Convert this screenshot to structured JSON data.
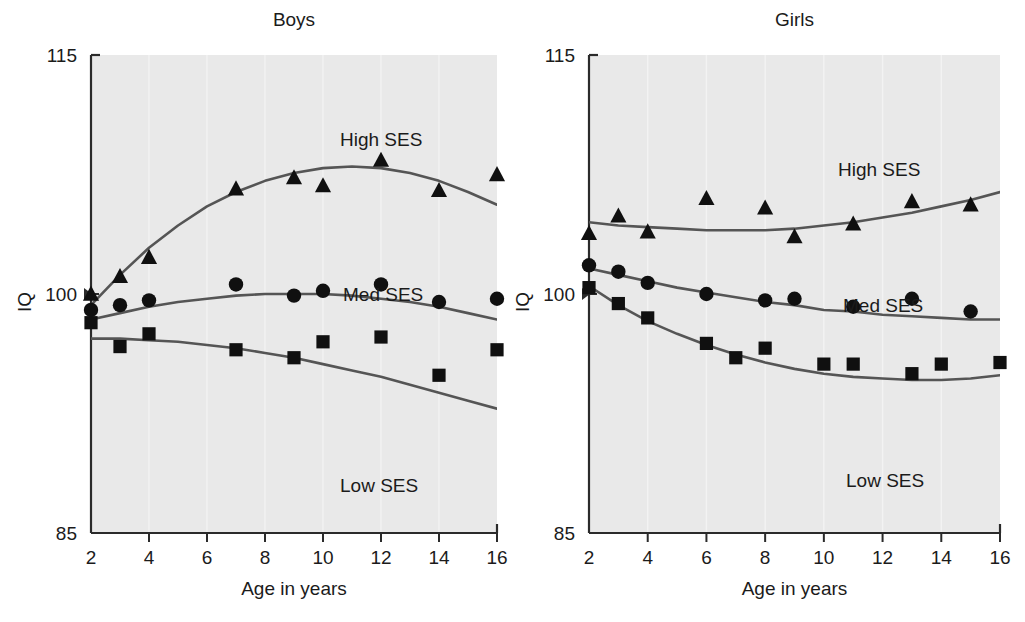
{
  "figure": {
    "background": "#ffffff",
    "plot_background": "#e9e9e9",
    "axis_color": "#2b2b2b",
    "marker_color": "#101010",
    "curve_color": "#555555"
  },
  "axis": {
    "y_label": "IQ",
    "x_label_boys": "Age in years",
    "x_label_girls": "Age in years",
    "y_ticks": [
      "115",
      "100",
      "85"
    ],
    "x_ticks": [
      "2",
      "4",
      "6",
      "8",
      "10",
      "12",
      "14",
      "16"
    ]
  },
  "panels": [
    {
      "key": "boys",
      "title": "Boys"
    },
    {
      "key": "girls",
      "title": "Girls"
    }
  ],
  "series_labels": {
    "high": "High SES",
    "med": "Med SES",
    "low": "Low SES"
  },
  "chart_data": [
    {
      "type": "scatter",
      "title": "Boys",
      "xlabel": "Age in years",
      "ylabel": "IQ",
      "xlim": [
        2,
        16
      ],
      "ylim": [
        85,
        115
      ],
      "grid": false,
      "legend_position": "inline-right",
      "series": [
        {
          "name": "High SES",
          "marker": "triangle",
          "x": [
            2,
            3,
            4,
            7,
            9,
            10,
            12,
            14,
            16
          ],
          "y": [
            100.0,
            101.1,
            102.3,
            106.6,
            107.3,
            106.8,
            108.4,
            106.5,
            107.5
          ],
          "fit_curve": {
            "x": [
              2,
              3,
              4,
              5,
              6,
              7,
              8,
              9,
              10,
              11,
              12,
              13,
              14,
              15,
              16
            ],
            "y": [
              99.3,
              101.2,
              102.9,
              104.3,
              105.5,
              106.4,
              107.1,
              107.6,
              107.9,
              108.0,
              107.9,
              107.6,
              107.1,
              106.4,
              105.6
            ]
          }
        },
        {
          "name": "Med SES",
          "marker": "circle",
          "x": [
            2,
            3,
            4,
            7,
            9,
            10,
            12,
            14,
            16
          ],
          "y": [
            99.0,
            99.3,
            99.6,
            100.6,
            99.9,
            100.2,
            100.6,
            99.5,
            99.7
          ],
          "fit_curve": {
            "x": [
              2,
              3,
              4,
              5,
              6,
              7,
              8,
              9,
              10,
              11,
              12,
              13,
              14,
              15,
              16
            ],
            "y": [
              98.4,
              98.8,
              99.2,
              99.5,
              99.7,
              99.9,
              100.0,
              100.0,
              100.0,
              99.9,
              99.7,
              99.5,
              99.2,
              98.8,
              98.4
            ]
          }
        },
        {
          "name": "Low SES",
          "marker": "square",
          "x": [
            2,
            3,
            4,
            7,
            9,
            10,
            12,
            14,
            16
          ],
          "y": [
            98.2,
            96.7,
            97.5,
            96.5,
            96.0,
            97.0,
            97.3,
            94.9,
            96.5
          ],
          "fit_curve": {
            "x": [
              2,
              3,
              4,
              5,
              6,
              7,
              8,
              9,
              10,
              11,
              12,
              13,
              14,
              15,
              16
            ],
            "y": [
              97.2,
              97.2,
              97.1,
              97.0,
              96.8,
              96.6,
              96.3,
              96.0,
              95.6,
              95.2,
              94.8,
              94.3,
              93.8,
              93.3,
              92.8
            ]
          }
        }
      ]
    },
    {
      "type": "scatter",
      "title": "Girls",
      "xlabel": "Age in years",
      "ylabel": "IQ",
      "xlim": [
        2,
        16
      ],
      "ylim": [
        85,
        115
      ],
      "grid": false,
      "legend_position": "inline-right",
      "series": [
        {
          "name": "High SES",
          "marker": "triangle",
          "x": [
            2,
            3,
            4,
            6,
            8,
            9,
            11,
            13,
            15
          ],
          "y": [
            103.8,
            104.9,
            103.9,
            106.0,
            105.4,
            103.6,
            104.4,
            105.8,
            105.6
          ],
          "fit_curve": {
            "x": [
              2,
              3,
              4,
              5,
              6,
              7,
              8,
              9,
              10,
              11,
              12,
              13,
              14,
              15,
              16
            ],
            "y": [
              104.5,
              104.3,
              104.2,
              104.1,
              104.0,
              104.0,
              104.0,
              104.1,
              104.3,
              104.5,
              104.8,
              105.1,
              105.5,
              105.9,
              106.4
            ]
          }
        },
        {
          "name": "Med SES",
          "marker": "circle",
          "x": [
            2,
            3,
            4,
            6,
            8,
            9,
            11,
            13,
            15
          ],
          "y": [
            101.8,
            101.4,
            100.7,
            100.0,
            99.6,
            99.7,
            99.2,
            99.7,
            98.9
          ],
          "fit_curve": {
            "x": [
              2,
              3,
              4,
              5,
              6,
              7,
              8,
              9,
              10,
              11,
              12,
              13,
              14,
              15,
              16
            ],
            "y": [
              101.6,
              101.2,
              100.8,
              100.4,
              100.1,
              99.8,
              99.5,
              99.3,
              99.0,
              98.9,
              98.7,
              98.6,
              98.5,
              98.4,
              98.4
            ]
          }
        },
        {
          "name": "Low SES",
          "marker": "square",
          "x": [
            2,
            3,
            4,
            6,
            7,
            8,
            10,
            11,
            13,
            14,
            16
          ],
          "y": [
            100.4,
            99.4,
            98.5,
            96.9,
            96.0,
            96.6,
            95.6,
            95.6,
            95.0,
            95.6,
            95.7
          ],
          "fit_curve": {
            "x": [
              2,
              3,
              4,
              5,
              6,
              7,
              8,
              9,
              10,
              11,
              12,
              13,
              14,
              15,
              16
            ],
            "y": [
              100.5,
              99.3,
              98.3,
              97.5,
              96.8,
              96.2,
              95.7,
              95.3,
              95.0,
              94.8,
              94.7,
              94.6,
              94.6,
              94.7,
              94.9
            ]
          }
        }
      ]
    }
  ]
}
